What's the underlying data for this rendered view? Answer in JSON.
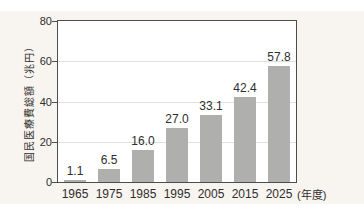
{
  "chart_data": {
    "type": "bar",
    "title": "",
    "ylabel": "国民医療費総額（兆円）",
    "xlabel_suffix": "(年度)",
    "categories": [
      "1965",
      "1975",
      "1985",
      "1995",
      "2005",
      "2015",
      "2025"
    ],
    "values": [
      1.1,
      6.5,
      16.0,
      27.0,
      33.1,
      42.4,
      57.8
    ],
    "value_labels": [
      "1.1",
      "6.5",
      "16.0",
      "27.0",
      "33.1",
      "42.4",
      "57.8"
    ],
    "ylim": [
      0,
      80
    ],
    "yticks": [
      0,
      20,
      40,
      60,
      80
    ],
    "ytick_labels": [
      "0",
      "20",
      "40",
      "60",
      "80"
    ],
    "gridlines_at": [
      20,
      40,
      60
    ],
    "grid": "horizontal",
    "legend": "none",
    "colors": {
      "bar": "#afafad",
      "panel_bg": "#f8f4ef",
      "plot_bg": "#ffffff",
      "axis": "#4d4d4d",
      "gridline": "#e0e0e0",
      "text": "#2e2e2e"
    }
  }
}
